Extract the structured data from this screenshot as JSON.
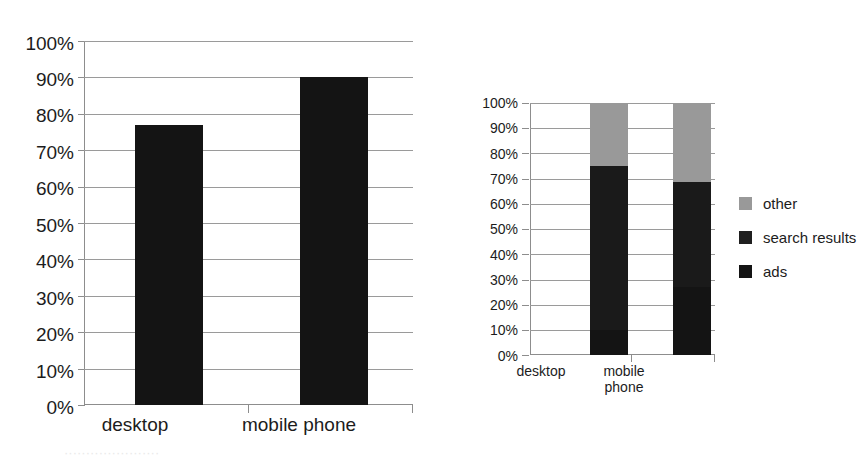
{
  "chart_data": [
    {
      "id": "left",
      "type": "bar",
      "title": "",
      "xlabel": "",
      "ylabel": "",
      "categories": [
        "desktop",
        "mobile phone"
      ],
      "values": [
        77,
        90
      ],
      "ylim": [
        0,
        100
      ],
      "y_ticks": [
        "0%",
        "10%",
        "20%",
        "30%",
        "40%",
        "50%",
        "60%",
        "70%",
        "80%",
        "90%",
        "100%"
      ],
      "y_tick_values": [
        0,
        10,
        20,
        30,
        40,
        50,
        60,
        70,
        80,
        90,
        100
      ],
      "grid": true,
      "legend": false,
      "series_color": "#141414"
    },
    {
      "id": "right",
      "type": "bar",
      "subtype": "stacked-100",
      "title": "",
      "xlabel": "",
      "ylabel": "",
      "categories": [
        "desktop",
        "mobile\nphone"
      ],
      "ylim": [
        0,
        100
      ],
      "y_ticks": [
        "0%",
        "10%",
        "20%",
        "30%",
        "40%",
        "50%",
        "60%",
        "70%",
        "80%",
        "90%",
        "100%"
      ],
      "y_tick_values": [
        0,
        10,
        20,
        30,
        40,
        50,
        60,
        70,
        80,
        90,
        100
      ],
      "grid": true,
      "legend": true,
      "legend_position": "right",
      "series": [
        {
          "name": "ads",
          "values": [
            10,
            27
          ],
          "color": "#141414"
        },
        {
          "name": "search results",
          "values": [
            65,
            41.5
          ],
          "color": "#1a1a1a"
        },
        {
          "name": "other",
          "values": [
            25,
            31.5
          ],
          "color": "#999999"
        }
      ],
      "stack_order_bottom_to_top": [
        "ads",
        "search results",
        "other"
      ],
      "legend_order_top_to_bottom": [
        "other",
        "search results",
        "ads"
      ]
    }
  ],
  "legend": {
    "items": [
      {
        "label": "other",
        "color": "#999999"
      },
      {
        "label": "search results",
        "color": "#1f1f1f"
      },
      {
        "label": "ads",
        "color": "#141414"
      }
    ]
  },
  "caption": {
    "cut_off_text": "······················"
  }
}
